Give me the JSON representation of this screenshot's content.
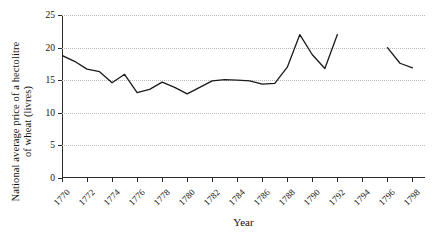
{
  "axes": {
    "ylabel_line1": "National average price of a hectolitre",
    "ylabel_line2": "of wheat (livres)",
    "xlabel": "Year",
    "yticks": [
      "0",
      "5",
      "10",
      "15",
      "20",
      "25"
    ],
    "xticks": [
      "1770",
      "1772",
      "1774",
      "1776",
      "1778",
      "1780",
      "1782",
      "1784",
      "1786",
      "1788",
      "1790",
      "1792",
      "1794",
      "1796",
      "1798"
    ]
  },
  "chart_data": {
    "type": "line",
    "title": "",
    "xlabel": "Year",
    "ylabel": "National average price of a hectolitre of wheat (livres)",
    "xlim": [
      1770,
      1799
    ],
    "ylim": [
      0,
      25
    ],
    "ytick_values": [
      0,
      5,
      10,
      15,
      20,
      25
    ],
    "xtick_values": [
      1770,
      1772,
      1774,
      1776,
      1778,
      1780,
      1782,
      1784,
      1786,
      1788,
      1790,
      1792,
      1794,
      1796,
      1798
    ],
    "grid": "horizontal-dotted",
    "legend": "none",
    "line_color": "#1a1a1a",
    "series": [
      {
        "name": "National average price of a hectolitre of wheat (livres)",
        "x": [
          1770,
          1771,
          1772,
          1773,
          1774,
          1775,
          1776,
          1777,
          1778,
          1779,
          1780,
          1781,
          1782,
          1783,
          1784,
          1785,
          1786,
          1787,
          1788,
          1789,
          1790,
          1791,
          1792
        ],
        "values": [
          18.8,
          17.9,
          16.7,
          16.3,
          14.6,
          15.9,
          13.1,
          13.6,
          14.7,
          13.9,
          12.9,
          13.9,
          14.9,
          15.1,
          15.0,
          14.9,
          14.4,
          14.5,
          17.0,
          22.0,
          18.9,
          16.8,
          22.0
        ]
      },
      {
        "name": "National average price of a hectolitre of wheat (livres) (resumed)",
        "x": [
          1796,
          1797,
          1798
        ],
        "values": [
          20.0,
          17.6,
          16.9
        ]
      }
    ],
    "gap_years": [
      1793,
      1794,
      1795
    ]
  }
}
